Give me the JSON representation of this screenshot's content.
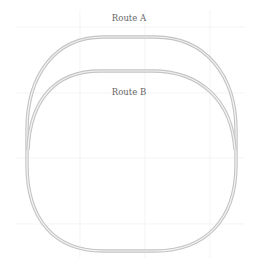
{
  "diagram": {
    "type": "track-layout",
    "background": "#ffffff",
    "grid": {
      "color": "#ececec",
      "vertical_x": [
        80,
        145,
        210
      ],
      "horizontal_y": [
        27,
        93,
        158,
        224
      ]
    },
    "track_color": "#b8b8b8",
    "rail_color": "#9a9a9a",
    "routes": [
      {
        "id": "route-a",
        "label": "Route A",
        "label_pos": [
          129,
          22
        ]
      },
      {
        "id": "route-b",
        "label": "Route B",
        "label_pos": [
          129,
          95
        ]
      }
    ]
  }
}
